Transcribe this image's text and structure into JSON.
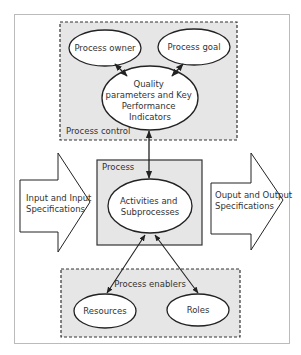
{
  "diagram": {
    "process_control": {
      "label": "Process control",
      "process_owner": "Process owner",
      "process_goal": "Process goal",
      "quality": [
        "Quality",
        "parameters and Key",
        "Performance",
        "Indicators"
      ]
    },
    "process": {
      "label": "Process",
      "activities": [
        "Activities and",
        "Subprocesses"
      ]
    },
    "input": [
      "Input and Input",
      "Specifications"
    ],
    "output": [
      "Ouput and Output",
      "Specifications"
    ],
    "process_enablers": {
      "label": "Process enablers",
      "resources": "Resources",
      "roles": "Roles"
    },
    "colors": {
      "box_fill": "#e6e6e6",
      "stroke": "#333333",
      "frame": "#bbbbbb"
    }
  }
}
